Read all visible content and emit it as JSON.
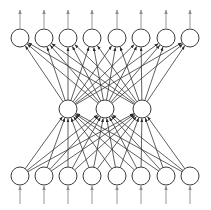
{
  "figure": {
    "title": "",
    "background_color": "#ffffff",
    "width": 211,
    "height": 210
  },
  "style": {
    "node_stroke_color": "#3a3a3a",
    "node_fill_color": "#ffffff",
    "edge_color": "#2b2b2b",
    "io_arrow_color": "#8a8a8a",
    "node_radius": 9,
    "edge_stroke_width": 0.75
  },
  "chart_data": {
    "type": "diagram",
    "diagram_kind": "neural-network",
    "title": "",
    "xlabel": "",
    "ylabel": "",
    "architecture": "8-3-8 fully connected autoencoder",
    "layers": [
      {
        "name": "output-layer",
        "role": "output",
        "count": 8,
        "center_y": 38,
        "node_x": [
          20,
          44,
          68,
          92,
          117,
          141,
          166,
          190
        ],
        "labels": [
          "",
          "",
          "",
          "",
          "",
          "",
          "",
          ""
        ]
      },
      {
        "name": "hidden-layer",
        "role": "hidden",
        "count": 3,
        "center_y": 109,
        "node_x": [
          68,
          105,
          142
        ],
        "labels": [
          "",
          "",
          ""
        ]
      },
      {
        "name": "input-layer",
        "role": "input",
        "count": 8,
        "center_y": 176,
        "node_x": [
          20,
          44,
          68,
          92,
          117,
          141,
          166,
          190
        ],
        "labels": [
          "",
          "",
          "",
          "",
          "",
          "",
          "",
          ""
        ]
      }
    ],
    "connections": [
      {
        "name": "input-to-hidden",
        "from_layer": "input-layer",
        "to_layer": "hidden-layer",
        "pattern": "fully-connected",
        "edge_count": 24,
        "arrowhead_at": "hidden-layer"
      },
      {
        "name": "hidden-to-output",
        "from_layer": "hidden-layer",
        "to_layer": "output-layer",
        "pattern": "fully-connected",
        "edge_count": 24,
        "arrowhead_at": "output-layer"
      }
    ],
    "external_arrows": [
      {
        "name": "input-feed-arrows",
        "count": 8,
        "direction": "up",
        "from_y": 204,
        "to_y": 186,
        "node_x": [
          20,
          44,
          68,
          92,
          117,
          141,
          166,
          190
        ]
      },
      {
        "name": "output-emit-arrows",
        "count": 8,
        "direction": "up",
        "from_y": 28,
        "to_y": 10,
        "node_x": [
          20,
          44,
          68,
          92,
          117,
          141,
          166,
          190
        ]
      }
    ]
  }
}
